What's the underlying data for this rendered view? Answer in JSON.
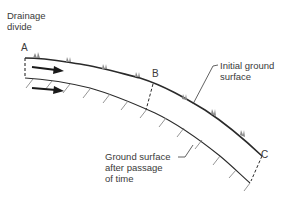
{
  "diagram": {
    "title": "",
    "labels": {
      "drainage_divide_line1": "Drainage",
      "drainage_divide_line2": "divide",
      "initial_ground_line1": "Initial ground",
      "initial_ground_line2": "surface",
      "after_passage_line1": "Ground surface",
      "after_passage_line2": "after passage",
      "after_passage_line3": "of time"
    },
    "points": {
      "a": "A",
      "b": "B",
      "c": "C"
    },
    "arrows": [
      {
        "name": "upper-flow-arrow",
        "direction": "downslope"
      },
      {
        "name": "lower-flow-arrow",
        "direction": "downslope"
      }
    ],
    "colors": {
      "line": "#2a2a2a",
      "hatch": "#7a7a7a",
      "vegetation": "#8a8a8a",
      "text": "#3a3a3a"
    }
  }
}
